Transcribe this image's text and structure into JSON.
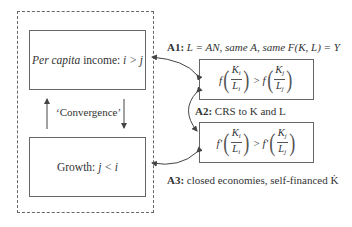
{
  "diagram": {
    "left_group": {
      "top_box": {
        "italic_prefix": "Per capita",
        "text": " income: ",
        "relation": "i > j"
      },
      "bottom_box": {
        "text": "Growth: ",
        "relation": "j < i"
      },
      "link_label": "‘Convergence’"
    },
    "right_group": {
      "formula_top": {
        "func": "f",
        "left": {
          "num": "K",
          "num_sub": "i",
          "den": "L",
          "den_sub": "i"
        },
        "op": ">",
        "right": {
          "num": "K",
          "num_sub": "j",
          "den": "L",
          "den_sub": "j"
        }
      },
      "formula_bottom": {
        "func": "f′",
        "left": {
          "num": "K",
          "num_sub": "i",
          "den": "L",
          "den_sub": "i"
        },
        "op": ">",
        "right": {
          "num": "K",
          "num_sub": "j",
          "den": "L",
          "den_sub": "j"
        }
      }
    },
    "assumptions": {
      "a1": {
        "tag": "A1:",
        "text": "L = AN, same A, same F(K, L) = Y"
      },
      "a2": {
        "tag": "A2:",
        "text": "CRS to K and L"
      },
      "a3": {
        "tag": "A3:",
        "text": "closed economies, self-financed K̇"
      }
    },
    "colors": {
      "line": "#555555",
      "text": "#333333",
      "background": "#ffffff"
    }
  }
}
